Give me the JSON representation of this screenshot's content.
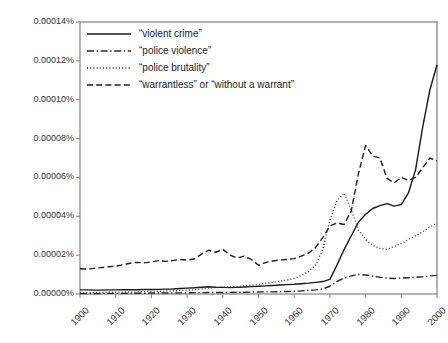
{
  "chart_data": {
    "type": "line",
    "title": "",
    "subtitle": "",
    "xlabel": "",
    "ylabel": "",
    "xlim": [
      1900,
      2000
    ],
    "ylim": [
      0,
      0.00014
    ],
    "grid": false,
    "legend_position": "top-left",
    "y_tick_labels": [
      "0.00014%",
      "0.00012%",
      "0.00010%",
      "0.00008%",
      "0.00006%",
      "0.00004%",
      "0.00002%",
      "0.00000%"
    ],
    "y_tick_values": [
      0.00014,
      0.00012,
      0.0001,
      8e-05,
      6e-05,
      4e-05,
      2e-05,
      0
    ],
    "x_tick_labels": [
      "1900",
      "1910",
      "1920",
      "1930",
      "1940",
      "1950",
      "1960",
      "1970",
      "1980",
      "1990",
      "2000"
    ],
    "x_tick_values": [
      1900,
      1910,
      1920,
      1930,
      1940,
      1950,
      1960,
      1970,
      1980,
      1990,
      2000
    ],
    "x": [
      1900,
      1902,
      1904,
      1906,
      1908,
      1910,
      1912,
      1914,
      1916,
      1918,
      1920,
      1922,
      1924,
      1926,
      1928,
      1930,
      1932,
      1934,
      1936,
      1938,
      1940,
      1942,
      1944,
      1946,
      1948,
      1950,
      1952,
      1954,
      1956,
      1958,
      1960,
      1962,
      1964,
      1966,
      1968,
      1970,
      1972,
      1974,
      1976,
      1978,
      1980,
      1982,
      1984,
      1986,
      1988,
      1990,
      1992,
      1994,
      1996,
      1998,
      2000
    ],
    "series": [
      {
        "name": "“violent crime”",
        "style": "solid",
        "color": "#1a1a1a",
        "values": [
          2.1e-06,
          2.1e-06,
          2e-06,
          2e-06,
          2.1e-06,
          2.1e-06,
          2.2e-06,
          2.2e-06,
          2.2e-06,
          2.3e-06,
          2.3e-06,
          2.4e-06,
          2.5e-06,
          2.6e-06,
          2.8e-06,
          3e-06,
          3.2e-06,
          3.5e-06,
          3.7e-06,
          3.5e-06,
          3.4e-06,
          3.3e-06,
          3.4e-06,
          3.6e-06,
          3.8e-06,
          4e-06,
          4.2e-06,
          4.4e-06,
          4.6e-06,
          4.8e-06,
          5e-06,
          5.3e-06,
          5.6e-06,
          6e-06,
          6.4e-06,
          7.5e-06,
          1.5e-05,
          2.3e-05,
          3e-05,
          3.7e-05,
          4.1e-05,
          4.4e-05,
          4.55e-05,
          4.65e-05,
          4.52e-05,
          4.6e-05,
          5.2e-05,
          6.4e-05,
          8.6e-05,
          0.000105,
          0.000118
        ]
      },
      {
        "name": "“police violence”",
        "style": "dashdot",
        "color": "#2b2b2b",
        "values": [
          2e-07,
          2e-07,
          2e-07,
          3e-07,
          3e-07,
          3e-07,
          3e-07,
          4e-07,
          4e-07,
          4e-07,
          5e-07,
          5e-07,
          5e-07,
          5e-07,
          6e-07,
          6e-07,
          7e-07,
          7e-07,
          8e-07,
          8e-07,
          8e-07,
          8e-07,
          9e-07,
          9e-07,
          1e-06,
          1e-06,
          1.1e-06,
          1.1e-06,
          1.2e-06,
          1.3e-06,
          1.4e-06,
          1.6e-06,
          1.8e-06,
          2.1e-06,
          2.6e-06,
          4e-06,
          6.5e-06,
          8.2e-06,
          9.3e-06,
          1e-05,
          9.8e-06,
          9.2e-06,
          8.6e-06,
          8.2e-06,
          8e-06,
          8.2e-06,
          8.4e-06,
          8.6e-06,
          8.9e-06,
          9.3e-06,
          9.6e-06
        ]
      },
      {
        "name": "“police brutality”",
        "style": "dotted",
        "color": "#3a3a3a",
        "values": [
          7e-07,
          7e-07,
          8e-07,
          8e-07,
          9e-07,
          9e-07,
          1e-06,
          1e-06,
          1.1e-06,
          1.2e-06,
          1.3e-06,
          1.4e-06,
          1.5e-06,
          1.6e-06,
          1.8e-06,
          2e-06,
          2.2e-06,
          2.6e-06,
          3e-06,
          3.3e-06,
          3.6e-06,
          3.6e-06,
          3.8e-06,
          4.2e-06,
          4.6e-06,
          5e-06,
          5.5e-06,
          6e-06,
          6.6e-06,
          7.2e-06,
          8e-06,
          9.5e-06,
          1.15e-05,
          1.5e-05,
          2.3e-05,
          3.8e-05,
          4.8e-05,
          5.2e-05,
          4.3e-05,
          3.3e-05,
          2.8e-05,
          2.5e-05,
          2.35e-05,
          2.3e-05,
          2.45e-05,
          2.6e-05,
          2.8e-05,
          3e-05,
          3.2e-05,
          3.45e-05,
          3.65e-05
        ]
      },
      {
        "name": "“warrantless” or “without a warrant”",
        "style": "dashed",
        "color": "#1f1f1f",
        "values": [
          1.3e-05,
          1.28e-05,
          1.32e-05,
          1.36e-05,
          1.4e-05,
          1.43e-05,
          1.5e-05,
          1.58e-05,
          1.63e-05,
          1.6e-05,
          1.65e-05,
          1.72e-05,
          1.68e-05,
          1.72e-05,
          1.78e-05,
          1.75e-05,
          1.8e-05,
          2.05e-05,
          2.25e-05,
          2.15e-05,
          2.3e-05,
          2e-05,
          1.85e-05,
          1.95e-05,
          1.78e-05,
          1.48e-05,
          1.62e-05,
          1.7e-05,
          1.75e-05,
          1.78e-05,
          1.82e-05,
          1.95e-05,
          2.1e-05,
          2.4e-05,
          2.9e-05,
          3.5e-05,
          3.65e-05,
          3.58e-05,
          4.3e-05,
          6.2e-05,
          7.65e-05,
          7.1e-05,
          7e-05,
          5.95e-05,
          5.72e-05,
          6e-05,
          5.85e-05,
          6e-05,
          6.5e-05,
          7e-05,
          6.85e-05
        ]
      }
    ]
  },
  "axis": {
    "frame_color": "#808080"
  }
}
